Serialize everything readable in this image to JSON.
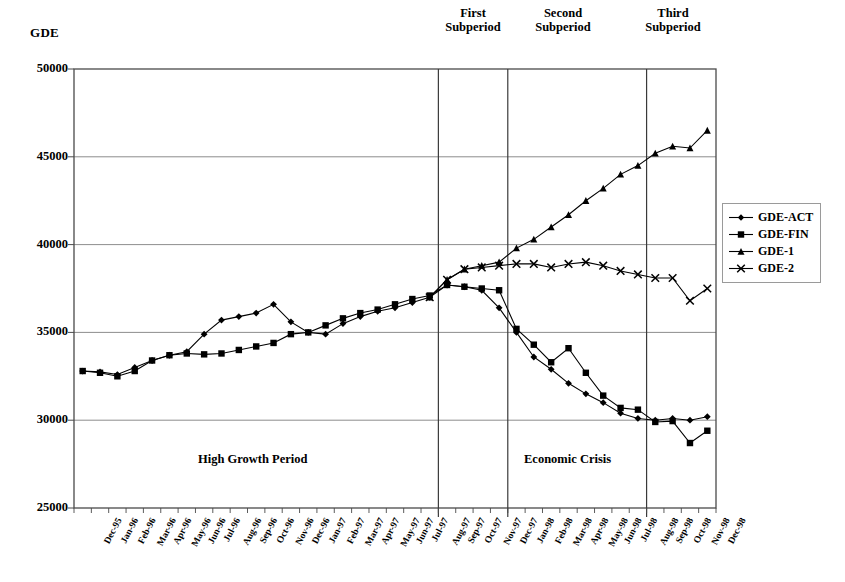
{
  "chart_data": {
    "type": "line",
    "title": "",
    "ylabel": "GDE",
    "xlabel": "",
    "ylim": [
      25000,
      50000
    ],
    "yticks": [
      25000,
      30000,
      35000,
      40000,
      45000,
      50000
    ],
    "ytick_labels": [
      "25000",
      "30000",
      "35000",
      "40000",
      "45000",
      "50000"
    ],
    "grid": true,
    "legend_position": "right",
    "categories": [
      "Dec-95",
      "Jan-96",
      "Feb-96",
      "Mar-96",
      "Apr-96",
      "May-96",
      "Jun-96",
      "Jul-96",
      "Aug-96",
      "Sep-96",
      "Oct-96",
      "Nov-96",
      "Dec-96",
      "Jan-97",
      "Feb-97",
      "Mar-97",
      "Apr-97",
      "May-97",
      "Jun-97",
      "Jul-97",
      "Aug-97",
      "Sep-97",
      "Oct-97",
      "Nov-97",
      "Dec-97",
      "Jan-98",
      "Feb-98",
      "Mar-98",
      "Apr-98",
      "May-98",
      "Jun-98",
      "Jul-98",
      "Aug-98",
      "Sep-98",
      "Oct-98",
      "Nov-98",
      "Dec-98"
    ],
    "series": [
      {
        "name": "GDE-ACT",
        "marker": "diamond",
        "values": [
          32800,
          32750,
          32600,
          33000,
          33400,
          33700,
          33900,
          34900,
          35700,
          35900,
          36100,
          36600,
          35600,
          35000,
          34900,
          35500,
          35900,
          36200,
          36400,
          36700,
          37000,
          37700,
          37600,
          37400,
          36400,
          35000,
          33600,
          32900,
          32100,
          31500,
          31000,
          30400,
          30100,
          30000,
          30100,
          30000,
          30200
        ]
      },
      {
        "name": "GDE-FIN",
        "marker": "square",
        "values": [
          32800,
          32700,
          32500,
          32800,
          33400,
          33700,
          33800,
          33750,
          33800,
          34000,
          34200,
          34400,
          34900,
          35000,
          35400,
          35800,
          36100,
          36300,
          36600,
          36900,
          37100,
          37700,
          37600,
          37500,
          37400,
          35200,
          34300,
          33300,
          34100,
          32700,
          31400,
          30700,
          30600,
          29900,
          29950,
          28700,
          29400
        ]
      },
      {
        "name": "GDE-1",
        "marker": "triangle",
        "values": [
          null,
          null,
          null,
          null,
          null,
          null,
          null,
          null,
          null,
          null,
          null,
          null,
          null,
          null,
          null,
          null,
          null,
          null,
          null,
          null,
          37000,
          38000,
          38600,
          38800,
          39000,
          39800,
          40300,
          41000,
          41700,
          42500,
          43200,
          44000,
          44500,
          45200,
          45600,
          45500,
          46500
        ]
      },
      {
        "name": "GDE-2",
        "marker": "cross",
        "values": [
          null,
          null,
          null,
          null,
          null,
          null,
          null,
          null,
          null,
          null,
          null,
          null,
          null,
          null,
          null,
          null,
          null,
          null,
          null,
          null,
          37000,
          38000,
          38600,
          38700,
          38800,
          38900,
          38900,
          38700,
          38900,
          39000,
          38800,
          38500,
          38300,
          38100,
          38100,
          36800,
          37500
        ]
      }
    ],
    "annotations": [
      {
        "text": "High Growth Period",
        "at": "Jun-96"
      },
      {
        "text": "Economic Crisis",
        "at": "Mar-98"
      }
    ],
    "vertical_dividers": [
      "Aug-97",
      "Dec-97",
      "Aug-98"
    ],
    "subperiod_labels": [
      {
        "line1": "First",
        "line2": "Subperiod"
      },
      {
        "line1": "Second",
        "line2": "Subperiod"
      },
      {
        "line1": "Third",
        "line2": "Subperiod"
      }
    ]
  }
}
